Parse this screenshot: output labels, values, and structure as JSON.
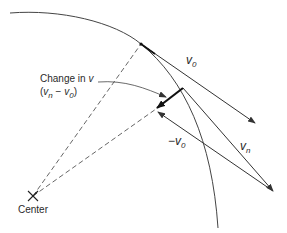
{
  "figure": {
    "labels": {
      "v0": {
        "main": "v",
        "sub": "0"
      },
      "vn": {
        "main": "v",
        "sub": "n"
      },
      "neg_v0": {
        "prefix": "−",
        "main": "v",
        "sub": "0"
      },
      "change_line1": "Change in ",
      "change_line1_var": "v",
      "change_line2_open": "(",
      "change_line2_v": "v",
      "change_line2_sub_n": "n",
      "change_line2_minus": " − ",
      "change_line2_v2": "v",
      "change_line2_sub_0": "0",
      "change_line2_close": ")",
      "center": "Center"
    },
    "colors": {
      "line": "#333333",
      "background": "#ffffff"
    }
  }
}
